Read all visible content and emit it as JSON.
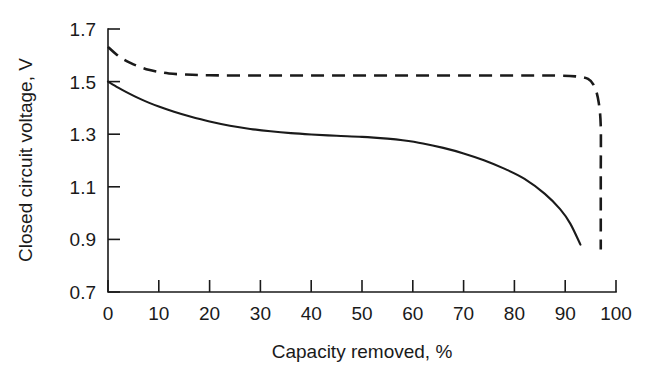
{
  "chart_data": {
    "type": "line",
    "title": "",
    "xlabel": "Capacity removed, %",
    "ylabel": "Closed circuit voltage, V",
    "xlim": [
      0,
      100
    ],
    "ylim": [
      0.7,
      1.7
    ],
    "xticks": [
      0,
      10,
      20,
      30,
      40,
      50,
      60,
      70,
      80,
      90,
      100
    ],
    "xticklabels": [
      "0",
      "10",
      "20",
      "30",
      "40",
      "50",
      "60",
      "70",
      "80",
      "90",
      "100"
    ],
    "yticks": [
      0.7,
      0.9,
      1.1,
      1.3,
      1.5,
      1.7
    ],
    "yticklabels": [
      "0.7",
      "0.9",
      "1.1",
      "1.3",
      "1.5",
      "1.7"
    ],
    "grid": false,
    "legend": "none",
    "axis_color": "#1a1a1a",
    "series": [
      {
        "name": "solid-discharge-curve",
        "style": "solid",
        "color": "#1a1a1a",
        "x": [
          0,
          2,
          4,
          6,
          8,
          10,
          13,
          16,
          20,
          24,
          28,
          32,
          36,
          40,
          45,
          50,
          55,
          58,
          62,
          66,
          70,
          74,
          78,
          82,
          86,
          89,
          91,
          93
        ],
        "y": [
          1.5,
          1.477,
          1.456,
          1.437,
          1.42,
          1.405,
          1.385,
          1.368,
          1.348,
          1.332,
          1.32,
          1.311,
          1.304,
          1.299,
          1.294,
          1.29,
          1.283,
          1.277,
          1.265,
          1.248,
          1.227,
          1.201,
          1.169,
          1.13,
          1.073,
          1.015,
          0.96,
          0.88
        ]
      },
      {
        "name": "dashed-discharge-curve",
        "style": "dashed",
        "color": "#1a1a1a",
        "x": [
          0,
          1.5,
          3,
          4.5,
          6,
          8,
          10,
          12,
          15,
          20,
          30,
          40,
          50,
          60,
          70,
          80,
          88,
          92,
          94.5,
          95.8,
          96.6,
          97,
          97,
          97,
          97
        ],
        "y": [
          1.632,
          1.606,
          1.585,
          1.57,
          1.558,
          1.545,
          1.537,
          1.531,
          1.527,
          1.524,
          1.523,
          1.523,
          1.523,
          1.523,
          1.523,
          1.523,
          1.523,
          1.52,
          1.51,
          1.48,
          1.42,
          1.33,
          1.15,
          0.98,
          0.862
        ]
      }
    ]
  }
}
